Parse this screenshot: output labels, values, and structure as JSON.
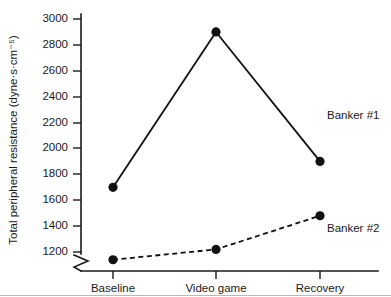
{
  "chart_data": {
    "type": "line",
    "title": "",
    "xlabel": "",
    "ylabel": "Total peripheral resistance (dyne·s·cm⁻⁵)",
    "categories": [
      "Baseline",
      "Video game",
      "Recovery"
    ],
    "series": [
      {
        "name": "Banker #1",
        "label": "Banker #1",
        "style": "solid",
        "marker": "filled-circle",
        "color": "#111111",
        "values": [
          1700,
          2900,
          1900
        ]
      },
      {
        "name": "Banker #2",
        "label": "Banker #2",
        "style": "dashed",
        "marker": "filled-circle",
        "color": "#111111",
        "values": [
          1140,
          1220,
          1480
        ]
      }
    ],
    "ylim": [
      1100,
      3060
    ],
    "yticks": [
      1200,
      1400,
      1600,
      1800,
      2000,
      2200,
      2400,
      2600,
      2800,
      3000
    ],
    "ytick_labels": [
      "1200",
      "1400",
      "1600",
      "1800",
      "2000",
      "2200",
      "2400",
      "2600",
      "2800",
      "3000"
    ],
    "y_axis_break": true,
    "y_axis_break_below": 1200,
    "grid": false,
    "legend": "inline-right-of-series"
  },
  "axes": {
    "y_title": "Total peripheral resistance (dyne·s·cm⁻⁵)",
    "x_categories": [
      "Baseline",
      "Video game",
      "Recovery"
    ],
    "y_tick_labels": [
      "3000",
      "2800",
      "2600",
      "2400",
      "2200",
      "2000",
      "1800",
      "1600",
      "1400",
      "1200"
    ]
  },
  "annotations": {
    "series_1_label": "Banker #1",
    "series_2_label": "Banker #2"
  },
  "colors": {
    "ink": "#111111",
    "axis": "#1a1a1a",
    "background": "#ffffff",
    "rule": "#b9b9b9"
  }
}
